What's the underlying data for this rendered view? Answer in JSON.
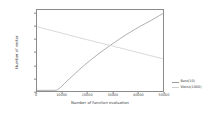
{
  "chart_data": {
    "type": "line",
    "title": "",
    "xlabel": "Number of function evaluation",
    "ylabel": "Number of vector",
    "xlim": [
      0,
      50000
    ],
    "ylim": [
      0,
      1260
    ],
    "grid": false,
    "legend_position": "right-outside",
    "xticks": [
      0,
      10000,
      20000,
      30000,
      40000,
      50000
    ],
    "xticklabels": [
      "0",
      "10000",
      "20000",
      "30000",
      "40000",
      "50000"
    ],
    "yticks": [
      0,
      200,
      400,
      600,
      800,
      1000,
      1200
    ],
    "yticklabels": [
      "0",
      "200",
      "400",
      "600",
      "800",
      "1000",
      "1200"
    ],
    "series": [
      {
        "name": "Best(10)",
        "color": "#9a9a9a",
        "x": [
          0,
          2000,
          4000,
          6000,
          7800,
          9000,
          11000,
          13000,
          15000,
          17000,
          19000,
          21000,
          23000,
          25000,
          27000,
          29000,
          31000,
          33000,
          35000,
          37000,
          39000,
          41000,
          43000,
          45000,
          47000,
          48500,
          50000
        ],
        "values": [
          10,
          10,
          10,
          10,
          12,
          45,
          120,
          195,
          268,
          340,
          408,
          472,
          535,
          596,
          652,
          708,
          762,
          815,
          866,
          915,
          962,
          1008,
          1050,
          1092,
          1138,
          1172,
          1205
        ]
      },
      {
        "name": "Worst(1000)",
        "color": "#cfcfcf",
        "x": [
          0,
          10000,
          20000,
          30000,
          40000,
          50000
        ],
        "values": [
          1000,
          898,
          797,
          700,
          600,
          500
        ]
      }
    ]
  },
  "legend": {
    "items": [
      {
        "label": "Best(10)",
        "color": "#9a9a9a"
      },
      {
        "label": "Worst(1000)",
        "color": "#cfcfcf"
      }
    ]
  }
}
